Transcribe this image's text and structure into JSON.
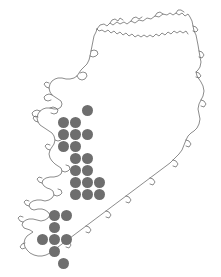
{
  "figure": {
    "region_name": "Ireland",
    "background_color": "#ffffff",
    "width": 221,
    "height": 277
  },
  "map": {
    "outline_color": "#5a5a5a",
    "outline_label": "ireland-coastline",
    "fill_color": "#ffffff"
  },
  "symbols": {
    "dot_color": "#6e6e6e",
    "dot_diameter": 11,
    "grid_spacing": 12,
    "dot_shape": "circle"
  },
  "chart_data": {
    "type": "scatter",
    "xlabel": "",
    "ylabel": "",
    "xlim": [
      0,
      221
    ],
    "ylim": [
      277,
      0
    ],
    "grid": false,
    "legend": null,
    "series": [
      {
        "name": "occurrence-records",
        "marker": "filled-circle",
        "color": "#6e6e6e",
        "size": 11,
        "count": 24,
        "points": [
          {
            "x": 87,
            "y": 110
          },
          {
            "x": 63,
            "y": 122
          },
          {
            "x": 75,
            "y": 122
          },
          {
            "x": 63,
            "y": 134
          },
          {
            "x": 75,
            "y": 134
          },
          {
            "x": 87,
            "y": 134
          },
          {
            "x": 63,
            "y": 146
          },
          {
            "x": 75,
            "y": 146
          },
          {
            "x": 75,
            "y": 158
          },
          {
            "x": 87,
            "y": 158
          },
          {
            "x": 75,
            "y": 170
          },
          {
            "x": 87,
            "y": 170
          },
          {
            "x": 75,
            "y": 182
          },
          {
            "x": 87,
            "y": 182
          },
          {
            "x": 99,
            "y": 182
          },
          {
            "x": 75,
            "y": 194
          },
          {
            "x": 87,
            "y": 194
          },
          {
            "x": 99,
            "y": 194
          },
          {
            "x": 54,
            "y": 215
          },
          {
            "x": 66,
            "y": 215
          },
          {
            "x": 54,
            "y": 227
          },
          {
            "x": 42,
            "y": 239
          },
          {
            "x": 54,
            "y": 239
          },
          {
            "x": 66,
            "y": 239
          },
          {
            "x": 54,
            "y": 251
          },
          {
            "x": 63,
            "y": 263
          }
        ]
      }
    ]
  }
}
